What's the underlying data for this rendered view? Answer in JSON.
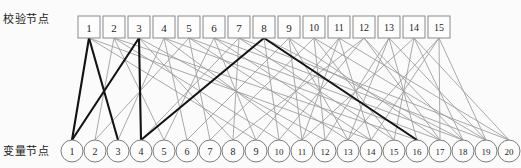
{
  "figure": {
    "background_color": "#fbfbfb",
    "width": 521,
    "height": 168
  },
  "labels": {
    "check_row": "校验节点",
    "variable_row": "变量节点"
  },
  "colors": {
    "edge_normal": "#9a9a9a",
    "edge_highlight": "#141414",
    "node_stroke": "#8a8a8a",
    "node_fill": "#fdfdfd",
    "text": "#1d1d1d"
  },
  "chart_data": {
    "type": "diagram",
    "subtype": "tanner-graph",
    "title": "",
    "check_nodes": {
      "count": 15,
      "shape": "square",
      "labels": [
        "1",
        "2",
        "3",
        "4",
        "5",
        "6",
        "7",
        "8",
        "9",
        "10",
        "11",
        "12",
        "13",
        "14",
        "15"
      ],
      "x": [
        78,
        103,
        128,
        153,
        178,
        203,
        228,
        253,
        278,
        303,
        328,
        353,
        378,
        403,
        428
      ],
      "y": 16,
      "box_width": 22,
      "box_height": 22
    },
    "variable_nodes": {
      "count": 20,
      "shape": "circle",
      "labels": [
        "1",
        "2",
        "3",
        "4",
        "5",
        "6",
        "7",
        "8",
        "9",
        "10",
        "11",
        "12",
        "13",
        "14",
        "15",
        "16",
        "17",
        "18",
        "19",
        "20"
      ],
      "x": [
        72,
        95,
        118,
        141,
        164,
        187,
        210,
        233,
        256,
        279,
        302,
        325,
        348,
        371,
        394,
        417,
        440,
        463,
        486,
        509
      ],
      "y": 151,
      "radius": 11
    },
    "edges_normal": [
      [
        1,
        1
      ],
      [
        1,
        3
      ],
      [
        1,
        9
      ],
      [
        1,
        14
      ],
      [
        2,
        2
      ],
      [
        2,
        5
      ],
      [
        2,
        10
      ],
      [
        2,
        16
      ],
      [
        3,
        1
      ],
      [
        3,
        4
      ],
      [
        3,
        8
      ],
      [
        3,
        12
      ],
      [
        4,
        3
      ],
      [
        4,
        6
      ],
      [
        4,
        11
      ],
      [
        4,
        17
      ],
      [
        5,
        2
      ],
      [
        5,
        7
      ],
      [
        5,
        13
      ],
      [
        5,
        18
      ],
      [
        6,
        5
      ],
      [
        6,
        9
      ],
      [
        6,
        14
      ],
      [
        6,
        19
      ],
      [
        7,
        4
      ],
      [
        7,
        8
      ],
      [
        7,
        15
      ],
      [
        7,
        20
      ],
      [
        8,
        4
      ],
      [
        8,
        10
      ],
      [
        8,
        16
      ],
      [
        8,
        18
      ],
      [
        9,
        6
      ],
      [
        9,
        11
      ],
      [
        9,
        13
      ],
      [
        9,
        17
      ],
      [
        10,
        7
      ],
      [
        10,
        12
      ],
      [
        10,
        15
      ],
      [
        10,
        19
      ],
      [
        11,
        9
      ],
      [
        11,
        11
      ],
      [
        11,
        14
      ],
      [
        11,
        20
      ],
      [
        12,
        8
      ],
      [
        12,
        10
      ],
      [
        12,
        17
      ],
      [
        12,
        18
      ],
      [
        13,
        12
      ],
      [
        13,
        13
      ],
      [
        13,
        16
      ],
      [
        13,
        19
      ],
      [
        14,
        11
      ],
      [
        14,
        15
      ],
      [
        14,
        18
      ],
      [
        14,
        20
      ],
      [
        15,
        13
      ],
      [
        15,
        14
      ],
      [
        15,
        17
      ],
      [
        15,
        19
      ]
    ],
    "edges_highlight": [
      [
        1,
        1
      ],
      [
        1,
        3
      ],
      [
        3,
        1
      ],
      [
        3,
        4
      ],
      [
        8,
        4
      ],
      [
        8,
        16
      ]
    ],
    "highlight_description": "bold cycle through check nodes 1, 3, 8 and variable nodes 1, 3, 4, 16",
    "legend": [],
    "xlabel": "",
    "ylabel": ""
  }
}
